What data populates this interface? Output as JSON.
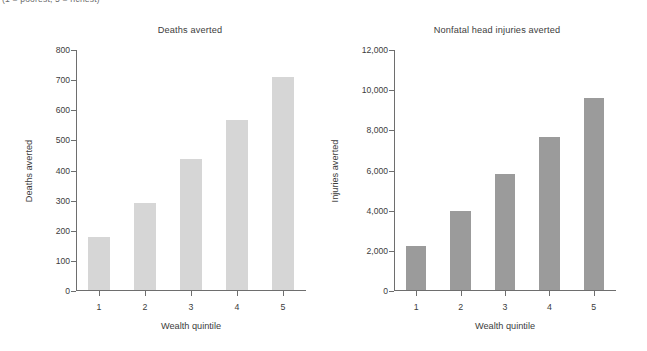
{
  "caption": {
    "text": "(1 = poorest, 5 = richest)"
  },
  "chart_data": [
    {
      "type": "bar",
      "panel": "left",
      "title": "Deaths averted",
      "xlabel": "Wealth quintile",
      "ylabel": "Deaths averted",
      "categories": [
        "1",
        "2",
        "3",
        "4",
        "5"
      ],
      "values": [
        176,
        290,
        435,
        563,
        708
      ],
      "ylim": [
        0,
        800
      ],
      "yticks": [
        0,
        100,
        200,
        300,
        400,
        500,
        600,
        700,
        800
      ],
      "ytick_labels": [
        "0",
        "100",
        "200",
        "300",
        "400",
        "500",
        "600",
        "700",
        "800"
      ],
      "bar_color": "#d6d6d6",
      "grid": false,
      "legend": false
    },
    {
      "type": "bar",
      "panel": "right",
      "title": "Nonfatal head injuries averted",
      "xlabel": "Wealth quintile",
      "ylabel": "Injuries averted",
      "categories": [
        "1",
        "2",
        "3",
        "4",
        "5"
      ],
      "values": [
        2200,
        3950,
        5800,
        7600,
        9550
      ],
      "ylim": [
        0,
        12000
      ],
      "yticks": [
        0,
        2000,
        4000,
        6000,
        8000,
        10000,
        12000
      ],
      "ytick_labels": [
        "0",
        "2,000",
        "4,000",
        "6,000",
        "8,000",
        "10,000",
        "12,000"
      ],
      "bar_color": "#9b9b9b",
      "grid": false,
      "legend": false
    }
  ]
}
